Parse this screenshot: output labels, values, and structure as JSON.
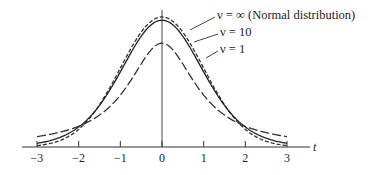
{
  "chart_data": {
    "type": "line",
    "title": "",
    "xlabel": "t",
    "ylabel": "",
    "xlim": [
      -3,
      3
    ],
    "ylim": [
      0,
      0.4
    ],
    "grid": false,
    "x_ticks": [
      -3,
      -2,
      -1,
      0,
      1,
      2,
      3
    ],
    "x_tick_labels": [
      "−3",
      "−2",
      "−1",
      "0",
      "1",
      "2",
      "3"
    ],
    "legend_position": "upper right, leader lines to curves",
    "series": [
      {
        "name": "ν = ∞ (Normal distribution)",
        "dof": "inf",
        "line_style": "short-dash",
        "x": [
          -3,
          -2.5,
          -2,
          -1.5,
          -1,
          -0.5,
          0,
          0.5,
          1,
          1.5,
          2,
          2.5,
          3
        ],
        "values": [
          0.0044,
          0.0175,
          0.054,
          0.1295,
          0.242,
          0.3521,
          0.3989,
          0.3521,
          0.242,
          0.1295,
          0.054,
          0.0175,
          0.0044
        ]
      },
      {
        "name": "ν = 10",
        "dof": 10,
        "line_style": "solid",
        "x": [
          -3,
          -2.5,
          -2,
          -1.5,
          -1,
          -0.5,
          0,
          0.5,
          1,
          1.5,
          2,
          2.5,
          3
        ],
        "values": [
          0.0114,
          0.0269,
          0.0611,
          0.1274,
          0.2304,
          0.3397,
          0.3891,
          0.3397,
          0.2304,
          0.1274,
          0.0611,
          0.0269,
          0.0114
        ]
      },
      {
        "name": "ν = 1",
        "dof": 1,
        "line_style": "long-dash",
        "x": [
          -3,
          -2.5,
          -2,
          -1.5,
          -1,
          -0.5,
          0,
          0.5,
          1,
          1.5,
          2,
          2.5,
          3
        ],
        "values": [
          0.0318,
          0.0439,
          0.0637,
          0.0979,
          0.1592,
          0.2546,
          0.3183,
          0.2546,
          0.1592,
          0.0979,
          0.0637,
          0.0439,
          0.0318
        ]
      }
    ]
  },
  "legend": {
    "normal_label": "ν = ∞ (Normal distribution)",
    "nu10_label": "ν = 10",
    "nu1_label": "ν = 1"
  },
  "axis": {
    "x_var": "t",
    "ticks": [
      "−3",
      "−2",
      "−1",
      "0",
      "1",
      "2",
      "3"
    ]
  }
}
